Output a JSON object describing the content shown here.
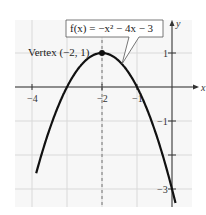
{
  "chart_data": {
    "type": "line",
    "title": "",
    "function_label": "f(x) = −x² − 4x − 3",
    "vertex_label": "Vertex (−2, 1)",
    "vertex": {
      "x": -2,
      "y": 1
    },
    "xlabel": "x",
    "ylabel": "y",
    "xlim": [
      -4.5,
      0.6
    ],
    "ylim": [
      -3.5,
      1.95
    ],
    "grid": true,
    "axis_of_symmetry": -2,
    "x_ticks": [
      {
        "value": -4,
        "label": "−4"
      },
      {
        "value": -2,
        "label": "−2"
      },
      {
        "value": -1,
        "label": "−1"
      }
    ],
    "y_ticks": [
      {
        "value": 1,
        "label": "1"
      },
      {
        "value": -1,
        "label": "−1"
      },
      {
        "value": -2,
        "label": ""
      },
      {
        "value": -3,
        "label": "−3"
      }
    ],
    "series": [
      {
        "name": "f(x) = −x² − 4x − 3",
        "x": [
          -3.88,
          -3.5,
          -3,
          -2.5,
          -2,
          -1.5,
          -1,
          -0.5,
          0,
          0.1
        ],
        "y": [
          -3.53,
          -1.25,
          0,
          0.75,
          1,
          0.75,
          0,
          -1.25,
          -3,
          -3.41
        ]
      }
    ]
  }
}
